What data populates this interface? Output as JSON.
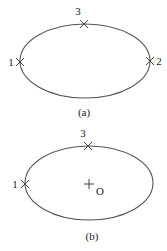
{
  "diagrams": [
    {
      "id": "a",
      "caption": "(a)",
      "ellipse": {
        "cx": 85,
        "cy": 61,
        "rx": 65,
        "ry": 37
      },
      "points": [
        {
          "label": "1",
          "x": 20,
          "y": 62,
          "marker": "x",
          "label_pos": "left"
        },
        {
          "label": "2",
          "x": 150,
          "y": 61,
          "marker": "x",
          "label_pos": "right"
        },
        {
          "label": "3",
          "x": 84,
          "y": 24,
          "marker": "x",
          "label_pos": "top"
        }
      ]
    },
    {
      "id": "b",
      "caption": "(b)",
      "ellipse": {
        "cx": 89,
        "cy": 183,
        "rx": 64,
        "ry": 37
      },
      "points": [
        {
          "label": "1",
          "x": 25,
          "y": 184,
          "marker": "x",
          "label_pos": "left"
        },
        {
          "label": "3",
          "x": 88,
          "y": 146,
          "marker": "x",
          "label_pos": "top"
        }
      ],
      "center": {
        "label": "O",
        "x": 89,
        "y": 184,
        "marker": "plus"
      }
    }
  ],
  "colors": {
    "stroke": "#555555",
    "text": "#222222",
    "background": "#ffffff"
  }
}
